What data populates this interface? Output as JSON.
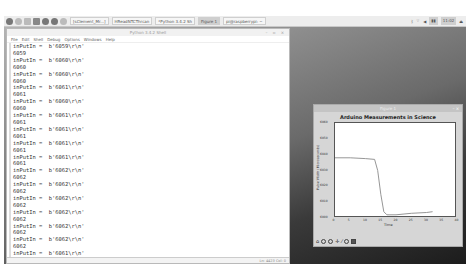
{
  "taskbar": {
    "tasks": [
      {
        "label": "[sClement_Mr...]",
        "active": false
      },
      {
        "label": "HReadNTCThrcan",
        "active": false
      },
      {
        "label": "*Python 3.4.2 Sh",
        "active": false
      },
      {
        "label": "Figure 1",
        "active": true
      },
      {
        "label": "pi@raspberrypi: ~",
        "active": false
      }
    ],
    "clock": "11:02",
    "icons": [
      "raspberry-menu-icon",
      "globe-icon",
      "file-manager-icon",
      "terminal-icon",
      "mathematica-icon",
      "wolfram-icon",
      "circle-app-icon"
    ],
    "tray_icons": [
      "bluetooth-icon",
      "wifi-icon",
      "volume-icon",
      "cpu-icon",
      "eject-icon"
    ]
  },
  "shell": {
    "title": "Python 3.4.2 Shell",
    "menu": [
      "File",
      "Edit",
      "Shell",
      "Debug",
      "Options",
      "Windows",
      "Help"
    ],
    "lines": [
      "inPutIn =  b'6059\\r\\n'",
      "6059",
      "inPutIn =  b'6060\\r\\n'",
      "6060",
      "inPutIn =  b'6060\\r\\n'",
      "6060",
      "inPutIn =  b'6061\\r\\n'",
      "6061",
      "inPutIn =  b'6060\\r\\n'",
      "6060",
      "inPutIn =  b'6061\\r\\n'",
      "6061",
      "inPutIn =  b'6061\\r\\n'",
      "6061",
      "inPutIn =  b'6061\\r\\n'",
      "6061",
      "inPutIn =  b'6061\\r\\n'",
      "6061",
      "inPutIn =  b'6062\\r\\n'",
      "6062",
      "inPutIn =  b'6062\\r\\n'",
      "6062",
      "inPutIn =  b'6062\\r\\n'",
      "6062",
      "inPutIn =  b'6062\\r\\n'",
      "6062",
      "inPutIn =  b'6062\\r\\n'",
      "6062",
      "inPutIn =  b'6062\\r\\n'",
      "6062",
      "inPutIn =  b'6061\\r\\n'",
      "6061",
      "inPutIn =  b'6061\\r\\n'",
      "6061"
    ],
    "status": "Ln: 4423 Col: 0"
  },
  "figure": {
    "window_title": "Figure 1",
    "toolbar": [
      "home-icon",
      "back-icon",
      "forward-icon",
      "pan-icon",
      "zoom-icon",
      "configure-icon",
      "save-icon"
    ]
  },
  "chart_data": {
    "type": "line",
    "title": "Arduino Measurements in Science",
    "xlabel": "Time",
    "ylabel": "Pulse Width (Microseconds)",
    "xlim": [
      0,
      40
    ],
    "ylim": [
      6000,
      6060
    ],
    "xticks": [
      0,
      5,
      10,
      15,
      20,
      25,
      30,
      35,
      40
    ],
    "yticks": [
      6000,
      6010,
      6020,
      6030,
      6040,
      6050,
      6060
    ],
    "x": [
      0,
      5,
      10,
      13,
      14,
      15,
      16,
      17,
      18,
      20,
      25,
      30,
      32
    ],
    "values": [
      6038,
      6038,
      6037.5,
      6037,
      6030,
      6015,
      6004,
      6002,
      6002,
      6002,
      6003,
      6003.5,
      6004
    ]
  }
}
